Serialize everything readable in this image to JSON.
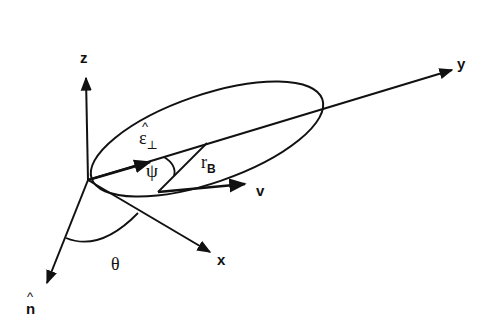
{
  "diagram": {
    "axes": {
      "z": "z",
      "y": "y",
      "x": "x",
      "n_hat": "n",
      "hat_mark": "^"
    },
    "vectors": {
      "epsilon_perp": {
        "symbol": "ε",
        "subscript": "⊥"
      },
      "r_B": {
        "symbol": "r",
        "subscript": "B"
      },
      "v": "v"
    },
    "angles": {
      "psi": "ψ",
      "theta": "θ"
    },
    "colors": {
      "stroke": "#111111",
      "background": "#ffffff"
    }
  }
}
